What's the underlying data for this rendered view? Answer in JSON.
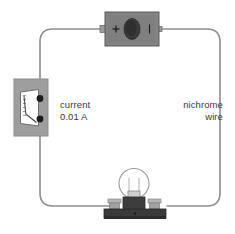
{
  "diagram": {
    "background_color": "#ffffff",
    "wire": {
      "name": "circuit-wire-loop",
      "color": "#8e8e8e",
      "width": 1.6,
      "corner_radius": 14
    },
    "labels": {
      "current": {
        "line1": "current",
        "line2": "0.01 A"
      },
      "nichrome": {
        "line1": "nichrome",
        "line2": "wire"
      }
    },
    "battery": {
      "name": "battery-cell",
      "body_color": "#7f7f7f",
      "border_color": "#5a5a5a",
      "terminal_color": "#9a9a9a",
      "oval_color": "#3a3a3a",
      "plus_sign": "+",
      "minus_sign": "–"
    },
    "ammeter": {
      "name": "ammeter",
      "body_color": "#9e9e9e",
      "border_color": "#8a8a8a",
      "face_color": "#ffffff",
      "face_border": "#6e6e6e",
      "needle_color": "#4a4a4a",
      "terminal_color": "#1c1c1c",
      "reading": "0.01 A"
    },
    "lamp": {
      "name": "lamp-bulb",
      "glass_fill": "#ffffff",
      "glass_stroke": "#9a9a9a",
      "socket_color": "#3d3d3d",
      "base_color": "#3a3a3a",
      "post_color": "#a8a8a8"
    }
  }
}
